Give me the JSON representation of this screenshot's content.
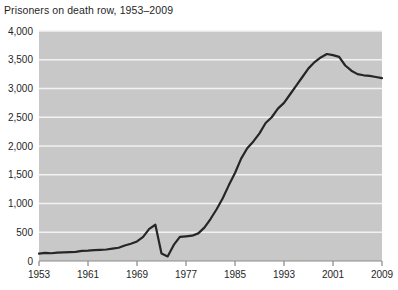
{
  "chart_data": {
    "type": "line",
    "title": "Prisoners on death row, 1953–2009",
    "xlabel": "",
    "ylabel": "",
    "xlim": [
      1953,
      2009
    ],
    "ylim": [
      0,
      4000
    ],
    "grid": true,
    "legend": "none",
    "plot_background": "#c8c8c8",
    "line_color": "#262626",
    "gridline_color": "#f2f2f2",
    "y_ticks": [
      0,
      500,
      1000,
      1500,
      2000,
      2500,
      3000,
      3500,
      4000
    ],
    "y_tick_labels": [
      "0",
      "500",
      "1,000",
      "1,500",
      "2,000",
      "2,500",
      "3,000",
      "3,500",
      "4,000"
    ],
    "x_ticks": [
      1953,
      1961,
      1969,
      1977,
      1985,
      1993,
      2001,
      2009
    ],
    "x_tick_labels": [
      "1953",
      "1961",
      "1969",
      "1977",
      "1985",
      "1993",
      "2001",
      "2009"
    ],
    "x": [
      1953,
      1954,
      1955,
      1956,
      1957,
      1958,
      1959,
      1960,
      1961,
      1962,
      1963,
      1964,
      1965,
      1966,
      1967,
      1968,
      1969,
      1970,
      1971,
      1972,
      1973,
      1974,
      1975,
      1976,
      1977,
      1978,
      1979,
      1980,
      1981,
      1982,
      1983,
      1984,
      1985,
      1986,
      1987,
      1988,
      1989,
      1990,
      1991,
      1992,
      1993,
      1994,
      1995,
      1996,
      1997,
      1998,
      1999,
      2000,
      2001,
      2002,
      2003,
      2004,
      2005,
      2006,
      2007,
      2008,
      2009
    ],
    "values": [
      130,
      140,
      135,
      145,
      150,
      155,
      160,
      175,
      180,
      190,
      195,
      200,
      215,
      230,
      270,
      300,
      340,
      420,
      560,
      630,
      130,
      80,
      280,
      420,
      430,
      440,
      480,
      580,
      730,
      900,
      1090,
      1320,
      1530,
      1780,
      1960,
      2080,
      2220,
      2400,
      2500,
      2650,
      2750,
      2900,
      3050,
      3200,
      3350,
      3460,
      3540,
      3600,
      3580,
      3550,
      3400,
      3310,
      3250,
      3230,
      3220,
      3200,
      3180
    ],
    "annotations": []
  }
}
